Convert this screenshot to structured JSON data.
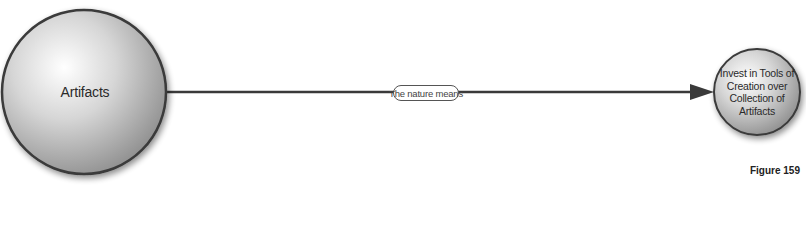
{
  "diagram": {
    "nodes": [
      {
        "id": "artifacts",
        "label": "Artifacts"
      },
      {
        "id": "invest",
        "label": "Invest in Tools of Creation over Collection of Artifacts"
      }
    ],
    "edges": [
      {
        "from": "artifacts",
        "to": "invest",
        "label": "The nature means"
      }
    ],
    "caption": "Figure 159"
  },
  "colors": {
    "node_fill_light": "#f4f4f4",
    "node_fill_dark": "#9a9a9a",
    "node_stroke": "#3a3a3a",
    "edge": "#3a3a3a",
    "text": "#2a2a2a"
  }
}
